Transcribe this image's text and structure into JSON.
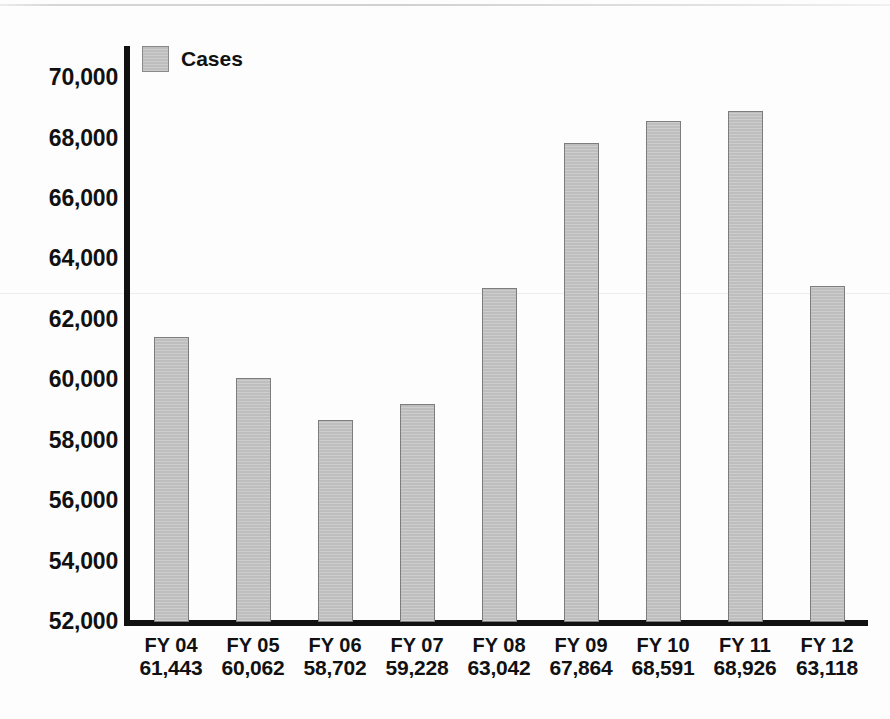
{
  "chart_data": {
    "type": "bar",
    "title": "",
    "xlabel": "",
    "ylabel": "",
    "grid": false,
    "legend_position": "top-left",
    "categories": [
      "FY 04",
      "FY 05",
      "FY 06",
      "FY 07",
      "FY 08",
      "FY 09",
      "FY 10",
      "FY 11",
      "FY 12"
    ],
    "values": [
      61443,
      60062,
      58702,
      59228,
      63042,
      67864,
      68591,
      68926,
      63118
    ],
    "value_labels": [
      "61,443",
      "60,062",
      "58,702",
      "59,228",
      "63,042",
      "67,864",
      "68,591",
      "68,926",
      "63,118"
    ],
    "series": [
      {
        "name": "Cases",
        "values": [
          61443,
          60062,
          58702,
          59228,
          63042,
          67864,
          68591,
          68926,
          63118
        ]
      }
    ],
    "ylim": [
      52000,
      71000
    ],
    "y_ticks": [
      52000,
      54000,
      56000,
      58000,
      60000,
      62000,
      64000,
      66000,
      68000,
      70000
    ],
    "y_tick_labels": [
      "52,000",
      "54,000",
      "56,000",
      "58,000",
      "60,000",
      "62,000",
      "64,000",
      "66,000",
      "68,000",
      "70,000"
    ],
    "bar_color": "#c3c3c3",
    "bar_border_color": "#7d7d7d",
    "axis_color": "#111111"
  },
  "legend": {
    "label": "Cases"
  }
}
